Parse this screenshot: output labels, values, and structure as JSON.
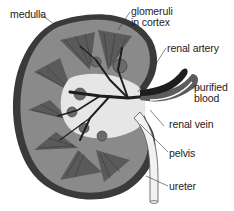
{
  "diagram": {
    "colors": {
      "cortex": "#7a7a7a",
      "capsule": "#3a3a3a",
      "medulla": "#5e5e5e",
      "pelvis": "#e8e8e8",
      "vessel_dark": "#1e1e1e",
      "ureter": "#f2f2f2",
      "label_text": "#222222"
    },
    "labels": [
      {
        "id": "medulla",
        "text": "medulla"
      },
      {
        "id": "glomeruli",
        "text": "glomeruli in cortex",
        "lines": [
          "glomeruli",
          "in cortex"
        ]
      },
      {
        "id": "renal_artery",
        "text": "renal artery"
      },
      {
        "id": "purified_blood",
        "text": "purified blood",
        "lines": [
          "purified",
          "blood"
        ]
      },
      {
        "id": "renal_vein",
        "text": "renal vein"
      },
      {
        "id": "pelvis",
        "text": "pelvis"
      },
      {
        "id": "ureter",
        "text": "ureter"
      }
    ]
  }
}
